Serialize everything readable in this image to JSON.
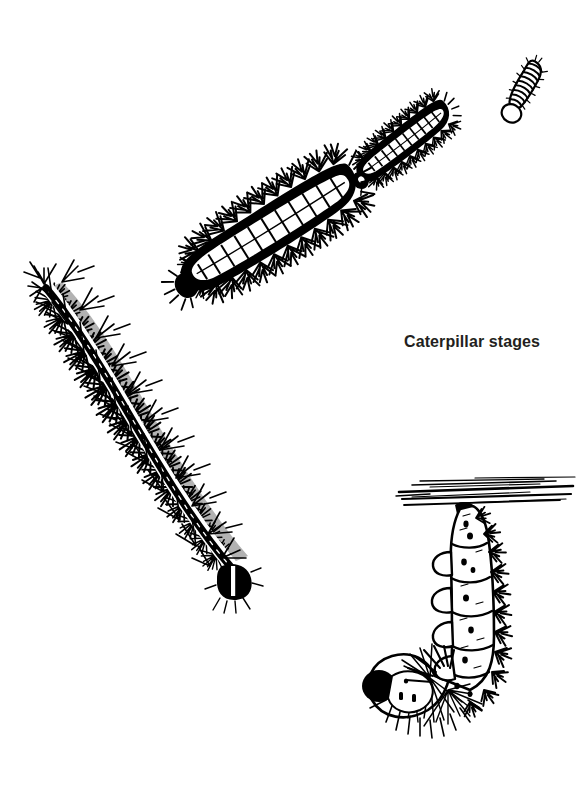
{
  "plate": {
    "title": "Caterpillar stages",
    "kind": "scientific-line-illustration",
    "technique": "pen-and-ink stipple / hatch",
    "background_color": "#ffffff",
    "ink_color": "#000000",
    "caption_color": "#231f20",
    "width_px": 584,
    "height_px": 811
  },
  "caption": {
    "text": "Caterpillar stages",
    "x_px": 404,
    "y_px": 333,
    "font_size_px": 16,
    "font_weight": "bold"
  },
  "figures": [
    {
      "id": "instar-1",
      "name": "first-instar-larva",
      "stage_label": "first instar",
      "description": "Smallest larva, tightly ringed segments, open circular head capsule at lower right end",
      "orientation_deg": 28,
      "bbox": {
        "x": 505,
        "y": 58,
        "w": 42,
        "h": 58
      },
      "size_rank": 1
    },
    {
      "id": "instar-2",
      "name": "second-instar-larva",
      "stage_label": "second instar",
      "description": "Dark body with pale dorsal stripe and short branched spines (scoli) along both sides; rounded head at lower right",
      "orientation_deg": 52,
      "bbox": {
        "x": 356,
        "y": 88,
        "w": 98,
        "h": 110
      },
      "size_rank": 2
    },
    {
      "id": "instar-3",
      "name": "third-instar-larva",
      "stage_label": "third instar",
      "description": "Larger dark larva, white segmented dorsal line, prominent branched scoli; dark head at lower right",
      "orientation_deg": 60,
      "bbox": {
        "x": 205,
        "y": 133,
        "w": 140,
        "h": 198
      },
      "size_rank": 3
    },
    {
      "id": "instar-final",
      "name": "final-instar-larva",
      "stage_label": "final instar",
      "description": "Largest larva, gently S-curved, densely covered in fine bristly branched spines, pale dorsal band flanking a dark mid-dorsal stripe; black head capsule with pale vertical stripe at lower right",
      "orientation_deg": 55,
      "bbox": {
        "x": 33,
        "y": 283,
        "w": 223,
        "h": 316
      },
      "size_rank": 4
    },
    {
      "id": "prepupa",
      "name": "prepupal-larva-hanging",
      "stage_label": "prepupa",
      "description": "Pre-pupal caterpillar hanging in a J-shape by its cremaster from a silk pad on a hatched twig; segments swollen, prolegs gripping, dark head at lower left",
      "orientation_deg": 0,
      "bbox": {
        "x": 355,
        "y": 478,
        "w": 220,
        "h": 280
      },
      "size_rank": 5,
      "support": {
        "name": "twig-branch",
        "description": "Horizontal hatched twig the larva hangs from",
        "bbox": {
          "x": 396,
          "y": 479,
          "w": 179,
          "h": 32
        }
      }
    }
  ]
}
